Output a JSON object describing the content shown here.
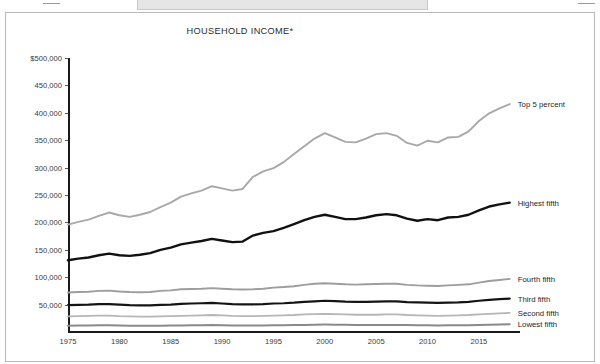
{
  "page": {
    "top_excerpt": "other Americans conflict with the political value of equality?"
  },
  "chart_data": {
    "type": "line",
    "title": "HOUSEHOLD INCOME*",
    "xlabel": "",
    "ylabel": "",
    "xlim": [
      1975,
      2019
    ],
    "ylim": [
      0,
      500000
    ],
    "grid": false,
    "legend_position": "right-inline-labels",
    "x_tick_labels": [
      "1975",
      "1980",
      "1985",
      "1990",
      "1995",
      "2000",
      "2005",
      "2010",
      "2015"
    ],
    "x_ticks": [
      1975,
      1980,
      1985,
      1990,
      1995,
      2000,
      2005,
      2010,
      2015
    ],
    "y_tick_labels": [
      "$500,000",
      "450,000",
      "400,000",
      "350,000",
      "300,000",
      "250,000",
      "200,000",
      "150,000",
      "100,000",
      "50,000"
    ],
    "y_ticks": [
      500000,
      450000,
      400000,
      350000,
      300000,
      250000,
      200000,
      150000,
      100000,
      50000
    ],
    "x": [
      1975,
      1976,
      1977,
      1978,
      1979,
      1980,
      1981,
      1982,
      1983,
      1984,
      1985,
      1986,
      1987,
      1988,
      1989,
      1990,
      1991,
      1992,
      1993,
      1994,
      1995,
      1996,
      1997,
      1998,
      1999,
      2000,
      2001,
      2002,
      2003,
      2004,
      2005,
      2006,
      2007,
      2008,
      2009,
      2010,
      2011,
      2012,
      2013,
      2014,
      2015,
      2016,
      2017,
      2018
    ],
    "series": [
      {
        "name": "Top 5 percent",
        "color": "#a8a8a8",
        "width": 1.9,
        "values": [
          196000,
          201000,
          205000,
          212000,
          218000,
          213000,
          210000,
          214000,
          219000,
          228000,
          236000,
          247000,
          253000,
          258000,
          266000,
          262000,
          258000,
          261000,
          283000,
          293000,
          299000,
          310000,
          325000,
          339000,
          353000,
          363000,
          355000,
          347000,
          346000,
          353000,
          361000,
          363000,
          358000,
          345000,
          340000,
          349000,
          346000,
          355000,
          356000,
          366000,
          385000,
          399000,
          408000,
          416000
        ]
      },
      {
        "name": "Highest fifth",
        "color": "#111111",
        "width": 2.4,
        "values": [
          131000,
          134000,
          136000,
          140000,
          143000,
          140000,
          139000,
          141000,
          144000,
          150000,
          154000,
          160000,
          163000,
          166000,
          170000,
          167000,
          164000,
          165000,
          176000,
          181000,
          184000,
          190000,
          197000,
          204000,
          210000,
          214000,
          210000,
          206000,
          206000,
          209000,
          213000,
          215000,
          213000,
          207000,
          203000,
          206000,
          204000,
          209000,
          210000,
          214000,
          222000,
          229000,
          233000,
          236000
        ]
      },
      {
        "name": "Fourth fifth",
        "color": "#9d9d9d",
        "width": 1.9,
        "values": [
          72000,
          73000,
          73500,
          75000,
          75500,
          74000,
          73000,
          72500,
          73000,
          75000,
          76000,
          78000,
          78500,
          79000,
          80000,
          79000,
          78000,
          77500,
          78000,
          79000,
          81000,
          82000,
          83500,
          86000,
          88000,
          89000,
          88000,
          87000,
          86500,
          87000,
          87500,
          88000,
          88000,
          86000,
          85000,
          84500,
          84000,
          85000,
          86000,
          87000,
          90000,
          93000,
          95000,
          97000
        ]
      },
      {
        "name": "Third fifth",
        "color": "#141414",
        "width": 2.2,
        "values": [
          49000,
          49500,
          50000,
          51000,
          51000,
          50000,
          49000,
          48500,
          48500,
          49500,
          50000,
          51500,
          52000,
          52500,
          53000,
          52000,
          51000,
          50500,
          50500,
          51000,
          52000,
          52500,
          53500,
          55000,
          56000,
          57000,
          56500,
          55500,
          55000,
          55000,
          55500,
          56000,
          56000,
          54500,
          54000,
          53500,
          53000,
          53500,
          54000,
          55000,
          57000,
          58500,
          60000,
          61000
        ]
      },
      {
        "name": "Second fifth",
        "color": "#b6b6b6",
        "width": 1.8,
        "values": [
          28500,
          29000,
          29500,
          30000,
          30000,
          29000,
          28500,
          28000,
          28000,
          28500,
          29000,
          29500,
          30000,
          30500,
          31000,
          30500,
          29500,
          29000,
          29000,
          29500,
          30000,
          30500,
          31000,
          32000,
          32500,
          33000,
          32500,
          32000,
          31500,
          31500,
          31500,
          32000,
          32000,
          31000,
          30500,
          30000,
          29500,
          30000,
          30500,
          31000,
          32000,
          33000,
          34000,
          35000
        ]
      },
      {
        "name": "Lowest fifth",
        "color": "#8a8a8a",
        "width": 2.0,
        "values": [
          11500,
          11800,
          12000,
          12200,
          12200,
          11800,
          11500,
          11300,
          11200,
          11500,
          11700,
          12000,
          12200,
          12400,
          12600,
          12300,
          12000,
          11800,
          11700,
          11900,
          12100,
          12300,
          12600,
          13000,
          13300,
          13500,
          13300,
          13100,
          12900,
          12900,
          12900,
          13000,
          13000,
          12600,
          12400,
          12200,
          12000,
          12100,
          12300,
          12500,
          12900,
          13300,
          13700,
          14000
        ]
      }
    ],
    "series_labels": [
      {
        "name": "Top 5 percent",
        "value_at_end": 416000
      },
      {
        "name": "Highest fifth",
        "value_at_end": 236000
      },
      {
        "name": "Fourth fifth",
        "value_at_end": 97000
      },
      {
        "name": "Third fifth",
        "value_at_end": 61000
      },
      {
        "name": "Second fifth",
        "value_at_end": 35000
      },
      {
        "name": "Lowest fifth",
        "value_at_end": 14000
      }
    ]
  }
}
